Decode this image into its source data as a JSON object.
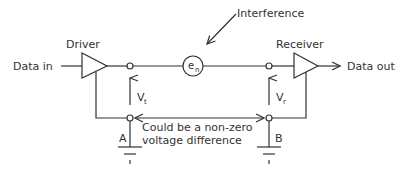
{
  "diagram": {
    "title": "",
    "labels": {
      "driver": "Driver",
      "receiver": "Receiver",
      "data_in": "Data in",
      "data_out": "Data out",
      "interference": "Interference",
      "noise_source_main": "e",
      "noise_source_sub": "n",
      "vt_main": "V",
      "vt_sub": "t",
      "vr_main": "V",
      "vr_sub": "r",
      "node_a": "A",
      "node_b": "B",
      "difference_line1": "Could be a non-zero",
      "difference_line2": "voltage difference"
    },
    "colors": {
      "stroke": "#333333",
      "background": "#ffffff"
    }
  }
}
